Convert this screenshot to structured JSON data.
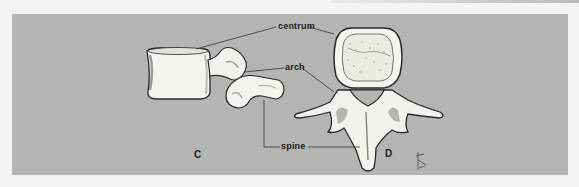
{
  "figure": {
    "labels": {
      "centrum": "centrum",
      "arch": "arch",
      "spine": "spine"
    },
    "views": [
      {
        "id": "C",
        "label": "C",
        "description": "lateral view of vertebra"
      },
      {
        "id": "D",
        "label": "D",
        "description": "superior view of vertebra"
      }
    ],
    "signature": "artist-monogram",
    "colors": {
      "panel": "#b4b4b2",
      "bone": "#f4f3ee",
      "outline": "#2a2a2a",
      "leader": "#333333"
    }
  }
}
